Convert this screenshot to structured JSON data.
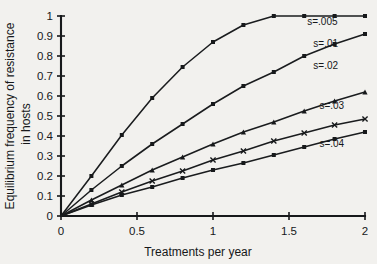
{
  "chart_data": {
    "type": "line",
    "title": "",
    "xlabel": "Treatments per year",
    "ylabel": "Equilibrium frequency of resistance in hosts",
    "ylabel_line1": "Equilibrium frequency of resistance",
    "ylabel_line2": "in hosts",
    "xlim": [
      0,
      2
    ],
    "ylim": [
      0,
      1
    ],
    "grid": false,
    "legend_position": "right-inline",
    "xticks": [
      0,
      0.5,
      1,
      1.5,
      2
    ],
    "xtick_labels": [
      "0",
      "0.5",
      "1",
      "1.5",
      "2"
    ],
    "yticks": [
      0,
      0.1,
      0.2,
      0.3,
      0.4,
      0.5,
      0.6,
      0.7,
      0.8,
      0.9,
      1
    ],
    "ytick_labels": [
      "0",
      "0.1",
      "0.2",
      "0.3",
      "0.4",
      "0.5",
      "0.6",
      "0.7",
      "0.8",
      "0.9",
      "1"
    ],
    "x": [
      0,
      0.2,
      0.4,
      0.6,
      0.8,
      1.0,
      1.2,
      1.4,
      1.6,
      1.8,
      2.0
    ],
    "series": [
      {
        "name": "s=.005",
        "marker": "square",
        "label_x": 1.62,
        "label_y": 0.955,
        "values": [
          0,
          0.13,
          0.25,
          0.36,
          0.46,
          0.56,
          0.65,
          0.72,
          0.8,
          0.86,
          0.91
        ]
      },
      {
        "name": "s=.01",
        "marker": "square",
        "label_x": 1.66,
        "label_y": 0.845,
        "values": [
          0,
          0.075,
          0.145,
          0.21,
          0.275,
          0.32,
          0.375,
          0.42,
          0.47,
          0.52,
          0.565
        ]
      },
      {
        "name": "s=.02",
        "marker": "square",
        "label_x": 1.66,
        "label_y": 0.735,
        "values": [
          0,
          0.055,
          0.105,
          0.145,
          0.19,
          0.23,
          0.265,
          0.305,
          0.34,
          0.38,
          0.42
        ]
      },
      {
        "name": "s=.03",
        "marker": "triangle",
        "label_x": 1.7,
        "label_y": 0.535,
        "values": [
          0,
          0.08,
          0.155,
          0.23,
          0.295,
          0.36,
          0.42,
          0.47,
          0.525,
          0.575,
          0.62
        ]
      },
      {
        "name": "s=.04",
        "marker": "cross",
        "label_x": 1.7,
        "label_y": 0.345,
        "values": [
          0,
          0.06,
          0.12,
          0.175,
          0.225,
          0.28,
          0.325,
          0.375,
          0.415,
          0.455,
          0.485
        ]
      }
    ],
    "curves_render_order": [
      {
        "name": "s=.005",
        "marker": "square",
        "values": [
          0,
          0.2,
          0.405,
          0.59,
          0.745,
          0.87,
          0.955,
          1.0,
          1.0,
          1.0,
          1.0
        ]
      },
      {
        "name": "s=.01",
        "marker": "square",
        "values": [
          0,
          0.13,
          0.25,
          0.36,
          0.46,
          0.56,
          0.65,
          0.72,
          0.8,
          0.86,
          0.91
        ]
      },
      {
        "name": "s=.02",
        "marker": "triangle",
        "values": [
          0,
          0.08,
          0.155,
          0.23,
          0.295,
          0.36,
          0.42,
          0.47,
          0.525,
          0.575,
          0.62
        ]
      },
      {
        "name": "s=.03",
        "marker": "cross",
        "values": [
          0,
          0.06,
          0.12,
          0.175,
          0.225,
          0.28,
          0.325,
          0.375,
          0.415,
          0.455,
          0.485
        ]
      },
      {
        "name": "s=.04",
        "marker": "square",
        "values": [
          0,
          0.055,
          0.105,
          0.145,
          0.19,
          0.23,
          0.265,
          0.305,
          0.345,
          0.385,
          0.42
        ]
      }
    ],
    "annotations": [
      {
        "text": "s=.005",
        "x": 1.62,
        "y": 0.955
      },
      {
        "text": "s=.01",
        "x": 1.66,
        "y": 0.845
      },
      {
        "text": "s=.02",
        "x": 1.66,
        "y": 0.735
      },
      {
        "text": "s=.03",
        "x": 1.7,
        "y": 0.535
      },
      {
        "text": "s=.04",
        "x": 1.7,
        "y": 0.345
      }
    ],
    "colors": {
      "background": "#f2f1ee",
      "ink": "#17191b"
    }
  }
}
